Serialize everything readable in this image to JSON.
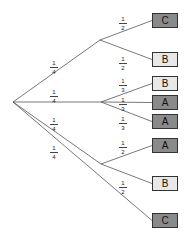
{
  "colors": {
    "dark": "#8a8a8a",
    "light": "#e8e8e8",
    "line": "#555555"
  },
  "root": {
    "x": 13,
    "y": 102
  },
  "branches": [
    {
      "prob_n": "1",
      "prob_d": "4",
      "node": {
        "x": 100,
        "y": 40
      },
      "label_pos": {
        "x": 54,
        "y": 60
      },
      "leaves": [
        {
          "label": "C",
          "shade": "dark",
          "y": 13,
          "prob_n": "1",
          "prob_d": "2",
          "lx": 123,
          "ly": 16
        },
        {
          "label": "B",
          "shade": "light",
          "y": 52,
          "prob_n": "1",
          "prob_d": "2",
          "lx": 123,
          "ly": 56
        }
      ]
    },
    {
      "prob_n": "1",
      "prob_d": "4",
      "node": {
        "x": 101,
        "y": 102
      },
      "label_pos": {
        "x": 54,
        "y": 89
      },
      "leaves": [
        {
          "label": "B",
          "shade": "light",
          "y": 76,
          "prob_n": "1",
          "prob_d": "3",
          "lx": 123,
          "ly": 78
        },
        {
          "label": "A",
          "shade": "dark",
          "y": 95,
          "prob_n": "1",
          "prob_d": "3",
          "lx": 123,
          "ly": 97
        },
        {
          "label": "A",
          "shade": "dark",
          "y": 114,
          "prob_n": "1",
          "prob_d": "3",
          "lx": 123,
          "ly": 116
        }
      ]
    },
    {
      "prob_n": "1",
      "prob_d": "4",
      "node": {
        "x": 101,
        "y": 164
      },
      "label_pos": {
        "x": 54,
        "y": 117
      },
      "leaves": [
        {
          "label": "A",
          "shade": "dark",
          "y": 138,
          "prob_n": "1",
          "prob_d": "2",
          "lx": 123,
          "ly": 140
        },
        {
          "label": "B",
          "shade": "light",
          "y": 176,
          "prob_n": "1",
          "prob_d": "2",
          "lx": 123,
          "ly": 180
        }
      ]
    },
    {
      "prob_n": "1",
      "prob_d": "4",
      "node": null,
      "label_pos": {
        "x": 54,
        "y": 145
      },
      "leaves": [
        {
          "label": "C",
          "shade": "dark",
          "y": 213,
          "prob_n": null,
          "prob_d": null
        }
      ]
    }
  ]
}
